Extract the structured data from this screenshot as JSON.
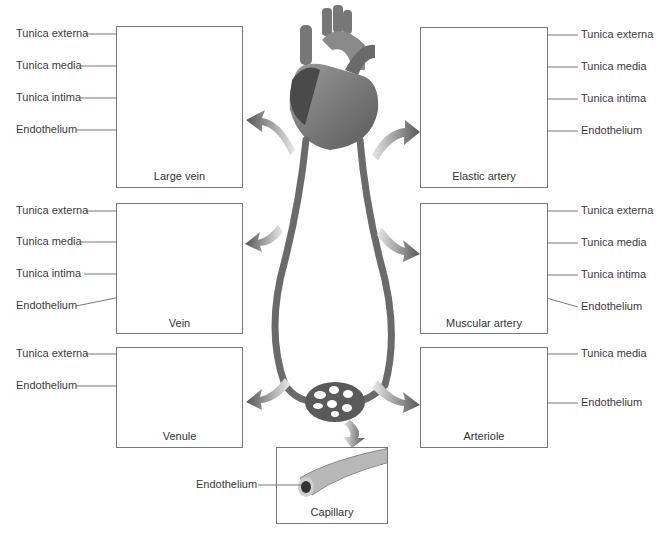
{
  "diagram": {
    "center": {
      "heart": "heart-illustration",
      "capillary_bed": "capillary-bed"
    },
    "panels": [
      {
        "id": "large-vein",
        "caption": "Large vein",
        "side": "left",
        "labels": [
          "Tunica externa",
          "Tunica media",
          "Tunica intima",
          "Endothelium"
        ]
      },
      {
        "id": "elastic-artery",
        "caption": "Elastic artery",
        "side": "right",
        "labels": [
          "Tunica externa",
          "Tunica media",
          "Tunica intima",
          "Endothelium"
        ]
      },
      {
        "id": "vein",
        "caption": "Vein",
        "side": "left",
        "labels": [
          "Tunica externa",
          "Tunica media",
          "Tunica intima",
          "Endothelium"
        ]
      },
      {
        "id": "muscular-artery",
        "caption": "Muscular artery",
        "side": "right",
        "labels": [
          "Tunica externa",
          "Tunica media",
          "Tunica intima",
          "Endothelium"
        ]
      },
      {
        "id": "venule",
        "caption": "Venule",
        "side": "left",
        "labels": [
          "Tunica externa",
          "Endothelium"
        ]
      },
      {
        "id": "arteriole",
        "caption": "Arteriole",
        "side": "right",
        "labels": [
          "Tunica media",
          "Endothelium"
        ]
      },
      {
        "id": "capillary",
        "caption": "Capillary",
        "side": "left",
        "labels": [
          "Endothelium"
        ]
      }
    ]
  }
}
